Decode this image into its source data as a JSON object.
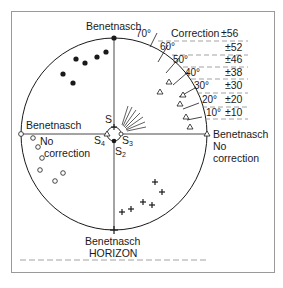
{
  "diagram": {
    "positions": {
      "top": "Benetnasch",
      "left": "Benetnasch",
      "right": "Benetnasch",
      "bottom": "Benetnasch"
    },
    "left_note": [
      "No",
      "correction"
    ],
    "right_note": [
      "No",
      "correction"
    ],
    "center_labels": {
      "s1": "S",
      "s2": "S",
      "s2_sub": "2",
      "s3": "S",
      "s3_sub": "3",
      "s4": "S",
      "s4_sub": "4"
    },
    "correction_header": "Correction",
    "correction_table": [
      {
        "angle": "70°",
        "correction": "±56"
      },
      {
        "angle": "60°",
        "correction": "±52"
      },
      {
        "angle": "50°",
        "correction": "±46"
      },
      {
        "angle": "40°",
        "correction": "±38"
      },
      {
        "angle": "30°",
        "correction": "±30"
      },
      {
        "angle": "20°",
        "correction": "±20"
      },
      {
        "angle": "10°",
        "correction": "±10"
      }
    ],
    "horizon_label": "HORIZON",
    "markers": {
      "filled_dots": "upper-left quadrant",
      "open_circles": "lower-left quadrant",
      "triangles": "upper-right quadrant",
      "crosses": "lower-right quadrant"
    },
    "colors": {
      "ink": "#1a1a1a",
      "dash": "#8a8a8a",
      "frame": "#9a9a9a"
    }
  }
}
